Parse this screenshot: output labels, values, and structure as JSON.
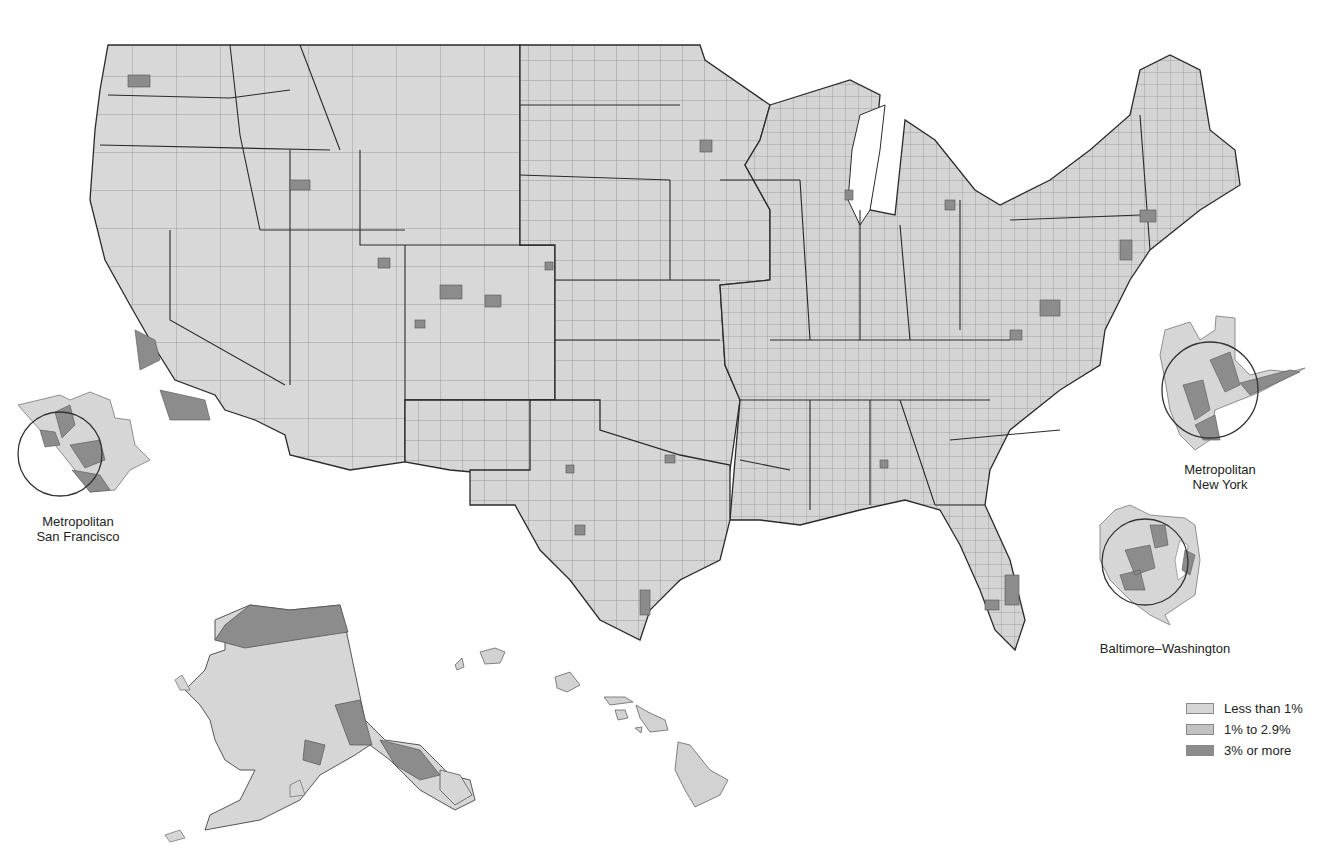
{
  "map": {
    "title_visible": false,
    "colors": {
      "background": "#ffffff",
      "low": "#d6d6d6",
      "mid": "#c2c2c2",
      "high": "#8c8c8c",
      "county_line": "#7a7a7a",
      "state_line": "#2a2a2a",
      "circle": "#333333"
    },
    "legend": {
      "items": [
        {
          "label": "Less than 1%",
          "color": "#d6d6d6",
          "class": "low"
        },
        {
          "label": "1% to 2.9%",
          "color": "#c2c2c2",
          "class": "mid"
        },
        {
          "label": "3% or more",
          "color": "#8c8c8c",
          "class": "high"
        }
      ]
    },
    "insets": [
      {
        "id": "san-francisco",
        "label_line1": "Metropolitan",
        "label_line2": "San Francisco"
      },
      {
        "id": "new-york",
        "label_line1": "Metropolitan",
        "label_line2": "New York"
      },
      {
        "id": "baltimore-washington",
        "label_line1": "Baltimore–Washington",
        "label_line2": ""
      }
    ],
    "regions": [
      "Contiguous United States (by county)",
      "Alaska",
      "Hawaii"
    ]
  }
}
